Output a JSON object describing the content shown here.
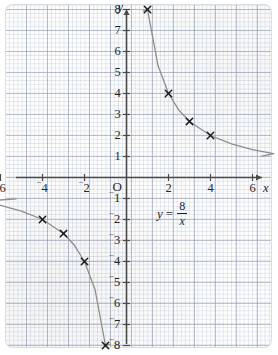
{
  "figure": {
    "kind": "coordinate-grid-graph",
    "equation": {
      "lhs": "y",
      "equals": "=",
      "numerator": "8",
      "denominator": "x"
    },
    "origin_label": "O",
    "x_axis_name": "x",
    "y_axis_name": "y",
    "colors": {
      "curve": "#8d8d8d",
      "axis": "#4a4a4a",
      "marker": "#1a1a1a",
      "grid_major": "#8c96aa",
      "grid_minor": "#a5b4c8",
      "paper": "#fdfdfd"
    }
  },
  "axes": {
    "x_ticks": [
      {
        "value": -6,
        "sign": "¯",
        "text": "6"
      },
      {
        "value": -4,
        "sign": "¯",
        "text": "4"
      },
      {
        "value": -2,
        "sign": "¯",
        "text": "2"
      },
      {
        "value": 2,
        "sign": "",
        "text": "2"
      },
      {
        "value": 4,
        "sign": "",
        "text": "4"
      },
      {
        "value": 6,
        "sign": "",
        "text": "6"
      }
    ],
    "y_ticks": [
      {
        "value": 8,
        "sign": "",
        "text": "8"
      },
      {
        "value": 7,
        "sign": "",
        "text": "7"
      },
      {
        "value": 6,
        "sign": "",
        "text": "6"
      },
      {
        "value": 5,
        "sign": "",
        "text": "5"
      },
      {
        "value": 4,
        "sign": "",
        "text": "4"
      },
      {
        "value": 3,
        "sign": "",
        "text": "3"
      },
      {
        "value": 2,
        "sign": "",
        "text": "2"
      },
      {
        "value": 1,
        "sign": "",
        "text": "1"
      },
      {
        "value": -1,
        "sign": "¯",
        "text": "1"
      },
      {
        "value": -2,
        "sign": "¯",
        "text": "2"
      },
      {
        "value": -3,
        "sign": "¯",
        "text": "3"
      },
      {
        "value": -4,
        "sign": "¯",
        "text": "4"
      },
      {
        "value": -5,
        "sign": "¯",
        "text": "5"
      },
      {
        "value": -6,
        "sign": "¯",
        "text": "6"
      },
      {
        "value": -7,
        "sign": "¯",
        "text": "7"
      },
      {
        "value": -8,
        "sign": "¯",
        "text": "8"
      }
    ]
  },
  "chart_data": {
    "type": "line",
    "title": "",
    "subtitle": "",
    "xlabel": "x",
    "ylabel": "y",
    "annotations": [
      "y = 8/x"
    ],
    "legend": [],
    "grid": true,
    "xlim": [
      -7,
      7
    ],
    "ylim": [
      -8.6,
      8.6
    ],
    "xticks": [
      -6,
      -4,
      -2,
      0,
      2,
      4,
      6
    ],
    "yticks": [
      -8,
      -7,
      -6,
      -5,
      -4,
      -3,
      -2,
      -1,
      1,
      2,
      3,
      4,
      5,
      6,
      7,
      8
    ],
    "series": [
      {
        "name": "y = 8/x (positive branch)",
        "style": "curve",
        "color": "#8d8d8d",
        "points": [
          {
            "x": 1,
            "y": 8
          },
          {
            "x": 1.5,
            "y": 5.33
          },
          {
            "x": 2,
            "y": 4
          },
          {
            "x": 2.5,
            "y": 3.2
          },
          {
            "x": 3,
            "y": 2.67
          },
          {
            "x": 4,
            "y": 2
          },
          {
            "x": 5,
            "y": 1.6
          },
          {
            "x": 6,
            "y": 1.33
          },
          {
            "x": 7,
            "y": 1.14
          }
        ]
      },
      {
        "name": "y = 8/x (negative branch)",
        "style": "curve",
        "color": "#8d8d8d",
        "points": [
          {
            "x": -7,
            "y": -1.14
          },
          {
            "x": -6,
            "y": -1.33
          },
          {
            "x": -5,
            "y": -1.6
          },
          {
            "x": -4,
            "y": -2
          },
          {
            "x": -3,
            "y": -2.67
          },
          {
            "x": -2.5,
            "y": -3.2
          },
          {
            "x": -2,
            "y": -4
          },
          {
            "x": -1.5,
            "y": -5.33
          },
          {
            "x": -1,
            "y": -8
          }
        ]
      }
    ],
    "marked_points": [
      {
        "x": 1,
        "y": 8
      },
      {
        "x": 2,
        "y": 4
      },
      {
        "x": 3,
        "y": 2.67
      },
      {
        "x": 4,
        "y": 2
      },
      {
        "x": -4,
        "y": -2
      },
      {
        "x": -3,
        "y": -2.67
      },
      {
        "x": -2,
        "y": -4
      },
      {
        "x": -1,
        "y": -8
      }
    ]
  }
}
